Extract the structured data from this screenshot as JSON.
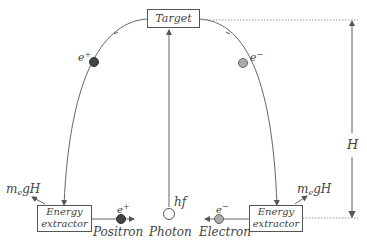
{
  "diagram": {
    "target_label": "Target",
    "height_label": "H",
    "left_extractor": {
      "line1": "Energy",
      "line2": "extractor"
    },
    "right_extractor": {
      "line1": "Energy",
      "line2": "extractor"
    },
    "left_energy_out": {
      "m": "m",
      "sub": "e",
      "rest": "gH"
    },
    "right_energy_out": {
      "m": "m",
      "sub": "e",
      "rest": "gH"
    },
    "particles": {
      "positron_label": "Positron",
      "photon_label": "Photon",
      "electron_label": "Electron",
      "photon_energy": "hf",
      "positron_symbol": {
        "base": "e",
        "sup": "+"
      },
      "electron_symbol": {
        "base": "e",
        "sup": "−"
      }
    },
    "colors": {
      "positron": "#444444",
      "electron": "#aaaaaa",
      "photon": "#ffffff",
      "line": "#555555"
    }
  }
}
